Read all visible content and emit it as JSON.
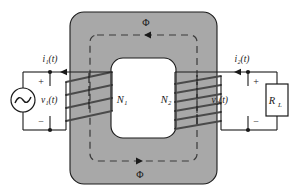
{
  "figure": {
    "name": "iron-core-transformer-schematic",
    "background_color": "#ffffff"
  },
  "colors": {
    "core_fill": "#a8a8a8",
    "core_stroke": "#1a1a1a",
    "window_fill": "#ffffff",
    "wire": "#1a1a1a",
    "flux_dash": "#3a3a3a",
    "winding": "#4a4a4a",
    "text": "#1a1a1a"
  },
  "core": {
    "label": "magnetic-core",
    "outer_corner_radius": 14,
    "inner_corner_radius": 12
  },
  "flux": {
    "top_label": "Φ",
    "bottom_label": "Φ",
    "top_direction": "right",
    "bottom_direction": "left",
    "style": "dashed"
  },
  "primary": {
    "current_label": "i₁(t)",
    "voltage_label": "v₁(t)",
    "turns_label": "N₁",
    "plus_sign": "+",
    "minus_sign": "−",
    "source_label": "ac-voltage-source",
    "turns_count": 4
  },
  "secondary": {
    "current_label": "i₂(t)",
    "voltage_label": "v₂(t)",
    "turns_label": "N₂",
    "plus_sign": "+",
    "minus_sign": "−",
    "load_label": "R",
    "load_subscript": "L",
    "turns_count": 6
  }
}
